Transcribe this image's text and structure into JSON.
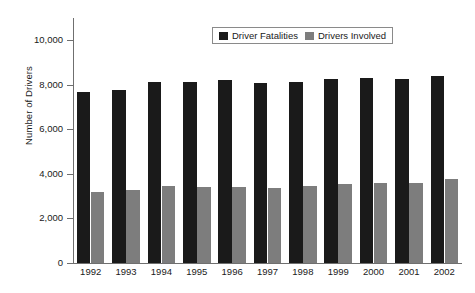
{
  "chart_data": {
    "type": "bar",
    "title": "",
    "xlabel": "",
    "ylabel": "Number of Drivers",
    "categories": [
      "1992",
      "1993",
      "1994",
      "1995",
      "1996",
      "1997",
      "1998",
      "1999",
      "2000",
      "2001",
      "2002"
    ],
    "series": [
      {
        "name": "Driver Fatalities",
        "color": "#1a1a1a",
        "values": [
          7690,
          7760,
          8140,
          8140,
          8230,
          8100,
          8140,
          8270,
          8310,
          8270,
          8400
        ]
      },
      {
        "name": "Drivers Involved",
        "color": "#7d7d7d",
        "values": [
          3200,
          3290,
          3470,
          3400,
          3420,
          3380,
          3450,
          3560,
          3600,
          3600,
          3780
        ]
      }
    ],
    "ylim": [
      0,
      11000
    ],
    "yticks": [
      0,
      2000,
      4000,
      6000,
      8000,
      10000
    ],
    "ytick_labels": [
      "0",
      "2,000",
      "4,000",
      "6,000",
      "8,000",
      "10,000"
    ],
    "grid": false,
    "legend_position": "top-center"
  },
  "legend": {
    "items": [
      {
        "label": "Driver Fatalities",
        "color": "#1a1a1a"
      },
      {
        "label": "Drivers Involved",
        "color": "#7d7d7d"
      }
    ]
  }
}
